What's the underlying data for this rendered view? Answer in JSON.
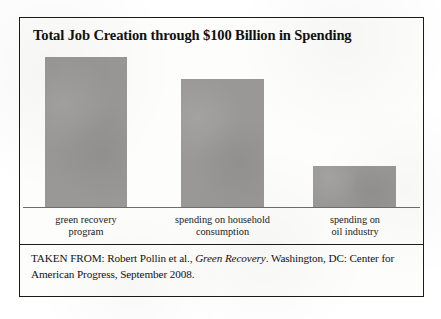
{
  "figure": {
    "title": "Total Job Creation through $100 Billion in Spending",
    "citation": {
      "prefix": "TAKEN FROM: Robert Pollin et al., ",
      "italic_title": "Green Recovery",
      "suffix": ". Washington, DC: Center for American Progress, September 2008."
    }
  },
  "chart_data": {
    "type": "bar",
    "title": "Total Job Creation through $100 Billion in Spending",
    "xlabel": "",
    "ylabel": "",
    "ylim": [
      0,
      2000000
    ],
    "grid": false,
    "legend": false,
    "bar_color": "#999897",
    "axis_color": "#6d6d6d",
    "categories": [
      "green recovery\nprogram",
      "spending on household\nconsumption",
      "spending on\noil industry"
    ],
    "values": [
      2000000,
      1700000,
      542000
    ],
    "value_labels": [
      "2 million jobs",
      "1.7 million jobs",
      "542,000 jobs"
    ]
  }
}
